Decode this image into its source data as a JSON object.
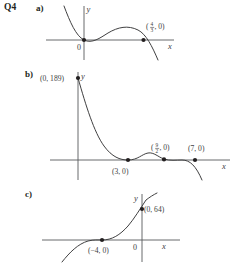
{
  "question": {
    "number": "Q4"
  },
  "parts": {
    "a": {
      "label": "a)",
      "origin_label": "0",
      "x_axis_label": "x",
      "y_axis_label": "y",
      "points": [
        {
          "name": "origin-double-root",
          "label": "0",
          "x": 0,
          "y": 0
        },
        {
          "name": "x-intercept-fraction",
          "label": "( 4/3 , 0)",
          "numerator": "4",
          "denominator": "3",
          "suffix": ", 0)",
          "prefix": "("
        }
      ],
      "shape": "negative cubic with double root at origin and single root at 4/3"
    },
    "b": {
      "label": "b)",
      "x_axis_label": "x",
      "y_axis_label": "y",
      "points": [
        {
          "name": "y-intercept",
          "label": "(0, 189)",
          "x": 0,
          "y": 189
        },
        {
          "name": "x-intercept-3",
          "label": "(3, 0)",
          "x": 3,
          "y": 0
        },
        {
          "name": "x-intercept-fraction",
          "prefix": "(",
          "numerator": "9",
          "denominator": "2",
          "suffix": ", 0)"
        },
        {
          "name": "x-intercept-7",
          "label": "(7, 0)",
          "x": 7,
          "y": 0
        }
      ],
      "shape": "steeply decreasing quartic from (0,189) touching axis at 3 and 9/2, crossing at 7"
    },
    "c": {
      "label": "c)",
      "origin_label": "0",
      "x_axis_label": "x",
      "y_axis_label": "y",
      "points": [
        {
          "name": "y-intercept",
          "label": "(0, 64)",
          "x": 0,
          "y": 64
        },
        {
          "name": "x-intercept-inflection",
          "label": "(−4, 0)",
          "x": -4,
          "y": 0
        }
      ],
      "shape": "increasing cubic with triple root (inflection) at x = -4 and y-intercept 64"
    }
  },
  "colors": {
    "ink": "#231f20",
    "axis": "#58595b",
    "curve": "#404041",
    "background": "#ffffff"
  }
}
